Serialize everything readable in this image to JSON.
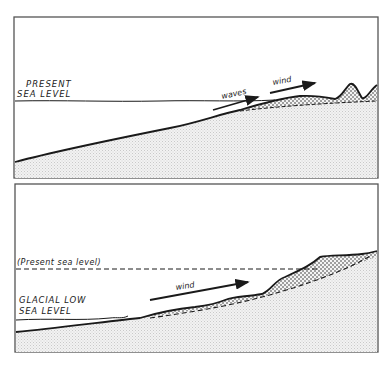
{
  "figure": {
    "panels": [
      {
        "id": "top",
        "title": "Present sea level",
        "labels": {
          "sea_level_line1": "PRESENT",
          "sea_level_line2": "SEA LEVEL",
          "waves": "waves",
          "wind": "wind"
        }
      },
      {
        "id": "bottom",
        "title": "Glacial low sea level",
        "labels": {
          "present_sea_level": "(Present sea level)",
          "glacial_line1": "GLACIAL LOW",
          "glacial_line2": "SEA LEVEL",
          "wind": "wind"
        }
      }
    ],
    "colors": {
      "line": "#1a1a1a",
      "land_fill": "#e4e4e4",
      "sand_fill": "#cfcfcf",
      "frame": "#555555"
    }
  }
}
